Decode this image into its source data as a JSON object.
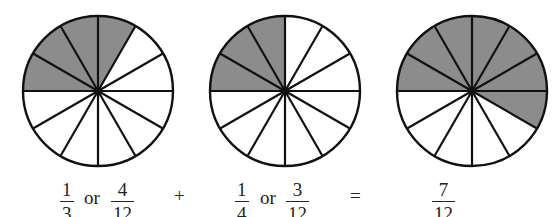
{
  "colors": {
    "shade": "#8c8c8c",
    "stroke": "#111111",
    "fill": "#ffffff"
  },
  "chart_data": {
    "type": "pie",
    "title": "",
    "pies": [
      {
        "sectors": 12,
        "shaded": 4,
        "cx": 98,
        "cy": 91,
        "r": 75,
        "start_deg": 60,
        "end_deg": 180
      },
      {
        "sectors": 12,
        "shaded": 3,
        "cx": 285,
        "cy": 91,
        "r": 75,
        "start_deg": 90,
        "end_deg": 180
      },
      {
        "sectors": 12,
        "shaded": 7,
        "cx": 472,
        "cy": 91,
        "r": 75,
        "start_deg": -30,
        "end_deg": 180
      }
    ]
  },
  "equation": {
    "term1": {
      "simple": {
        "num": "1",
        "den": "3"
      },
      "or": "or",
      "twelfths": {
        "num": "4",
        "den": "12"
      }
    },
    "plus": "+",
    "term2": {
      "simple": {
        "num": "1",
        "den": "4"
      },
      "or": "or",
      "twelfths": {
        "num": "3",
        "den": "12"
      }
    },
    "equals": "=",
    "result": {
      "num": "7",
      "den": "12"
    }
  }
}
